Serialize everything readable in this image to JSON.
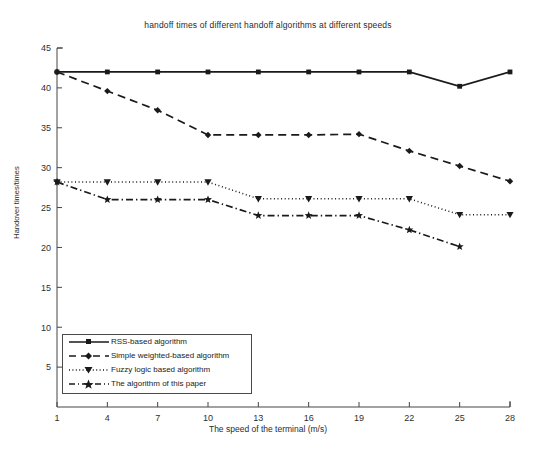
{
  "chart_data": {
    "type": "line",
    "title": "handoff times of different handoff algorithms at different speeds",
    "xlabel": "The speed of the terminal (m/s)",
    "ylabel": "Handover times/times",
    "grid": false,
    "legend_position": "lower-left",
    "x": [
      1,
      4,
      7,
      10,
      13,
      16,
      19,
      22,
      25,
      28
    ],
    "xticks": [
      "1",
      "4",
      "7",
      "10",
      "13",
      "16",
      "19",
      "22",
      "25",
      "28"
    ],
    "yticks": [
      "0",
      "5",
      "10",
      "15",
      "20",
      "25",
      "30",
      "35",
      "40",
      "45"
    ],
    "xlim": [
      1,
      28
    ],
    "ylim": [
      0,
      45
    ],
    "series": [
      {
        "name": "RSS-based algorithm",
        "linestyle": "solid",
        "marker": "square",
        "color": "#1a1a1a",
        "values": [
          42,
          42,
          42,
          42,
          42,
          42,
          42,
          42,
          40.2,
          42
        ]
      },
      {
        "name": "Simple weighted-based algorithm",
        "linestyle": "dashed",
        "marker": "diamond",
        "color": "#1a1a1a",
        "values": [
          42,
          39.6,
          37.2,
          34.1,
          34.1,
          34.1,
          34.2,
          32.1,
          30.2,
          28.3
        ]
      },
      {
        "name": "Fuzzy logic based algorithm",
        "linestyle": "dotted",
        "marker": "triangle-down",
        "color": "#1a1a1a",
        "values": [
          28.2,
          28.2,
          28.2,
          28.2,
          26.1,
          26.1,
          26.1,
          26.1,
          24.1,
          24.1
        ]
      },
      {
        "name": "The algorithm of this paper",
        "linestyle": "dashdot",
        "marker": "star",
        "color": "#1a1a1a",
        "values": [
          28.2,
          26.0,
          26.0,
          26.0,
          24.0,
          24.0,
          24.0,
          22.2,
          20.1,
          null
        ]
      }
    ]
  },
  "legend": {
    "items": [
      {
        "label": "RSS-based algorithm"
      },
      {
        "label": "Simple weighted-based algorithm"
      },
      {
        "label": "Fuzzy logic based algorithm"
      },
      {
        "label": "The algorithm of this paper"
      }
    ]
  }
}
